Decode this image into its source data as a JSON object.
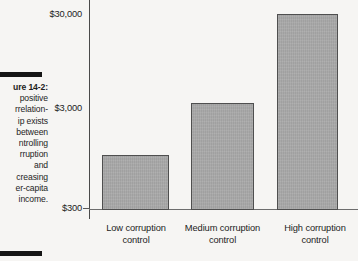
{
  "figure": {
    "caption_title": "ure 14-2:",
    "caption_lines": [
      "positive",
      "rrelation-",
      "ip exists",
      "between",
      "ntrolling",
      "rruption",
      "and",
      "creasing",
      "er-capita",
      "income."
    ]
  },
  "chart_data": {
    "type": "bar",
    "title": "",
    "xlabel": "",
    "ylabel": "",
    "categories": [
      "Low corruption control",
      "Medium corruption control",
      "High corruption control"
    ],
    "category_lines": [
      [
        "Low corruption",
        "control"
      ],
      [
        "Medium corruption",
        "control"
      ],
      [
        "High corruption",
        "control"
      ]
    ],
    "values": [
      900,
      4500,
      28000
    ],
    "yscale": "log",
    "ylim": [
      300,
      30000
    ],
    "ytick_labels": [
      "$30,000",
      "$3,000",
      "$300"
    ],
    "ytick_values": [
      30000,
      3000,
      300
    ],
    "grid": false,
    "legend": "none",
    "bar_color": "#a9a9a9",
    "bar_border_color": "#4f4f4f",
    "axis_color": "#4a4a4a",
    "background_color": "#f6f5f3",
    "text_color": "#1d1d1d",
    "bars_px": [
      {
        "left": 102,
        "width": 67,
        "top": 155,
        "height": 55
      },
      {
        "left": 191,
        "width": 63,
        "top": 103,
        "height": 107
      },
      {
        "left": 277,
        "width": 61,
        "top": 14,
        "height": 196
      }
    ],
    "ytick_px": [
      14,
      108,
      208
    ]
  }
}
